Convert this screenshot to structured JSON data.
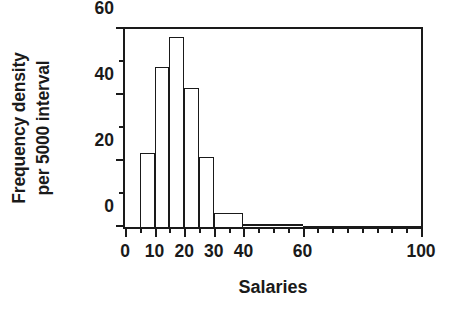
{
  "chart_data": {
    "type": "bar",
    "title": "",
    "subtitle": "",
    "xlabel": "Salaries",
    "ylabel": "Frequency density per 5000 interval",
    "ylabel_line1": "Frequency density",
    "ylabel_line2": "per 5000 interval",
    "xlim": [
      0,
      100
    ],
    "ylim": [
      0,
      60
    ],
    "grid": false,
    "legend": null,
    "x_major_ticks": [
      0,
      10,
      20,
      30,
      40,
      60,
      100
    ],
    "x_tick_labels": [
      "0",
      "10",
      "20",
      "30",
      "40",
      "60",
      "100"
    ],
    "x_minor_ticks": [
      5,
      15,
      25,
      35,
      45,
      50,
      55,
      65,
      70,
      75,
      80,
      85,
      90,
      95
    ],
    "y_major_ticks": [
      0,
      20,
      40,
      60
    ],
    "y_tick_labels": [
      "0",
      "20",
      "40",
      "60"
    ],
    "y_minor_ticks": [
      10,
      30,
      50
    ],
    "bins": [
      {
        "label": "5-10",
        "x0": 5,
        "x1": 10,
        "value": 22.3
      },
      {
        "label": "10-15",
        "x0": 10,
        "x1": 15,
        "value": 48.4
      },
      {
        "label": "15-20",
        "x0": 15,
        "x1": 20,
        "value": 57.6
      },
      {
        "label": "20-25",
        "x0": 20,
        "x1": 25,
        "value": 42.2
      },
      {
        "label": "25-30",
        "x0": 25,
        "x1": 30,
        "value": 21.3
      },
      {
        "label": "30-40",
        "x0": 30,
        "x1": 40,
        "value": 4.2
      },
      {
        "label": "40-60",
        "x0": 40,
        "x1": 60,
        "value": 1.0
      },
      {
        "label": "60-100",
        "x0": 60,
        "x1": 100,
        "value": 0.3
      }
    ],
    "categories": [
      "5-10",
      "10-15",
      "15-20",
      "20-25",
      "25-30",
      "30-40",
      "40-60",
      "60-100"
    ],
    "values": [
      22.3,
      48.4,
      57.6,
      42.2,
      21.3,
      4.2,
      1.0,
      0.3
    ],
    "colors": {
      "axis": "#1a1a1a",
      "bar_fill": "#ffffff",
      "bar_edge": "#1a1a1a",
      "background": "#ffffff"
    }
  }
}
